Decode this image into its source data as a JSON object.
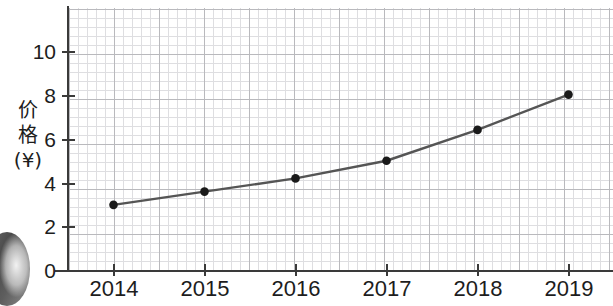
{
  "chart_data": {
    "type": "line",
    "title": "",
    "subtitle": "",
    "xlabel": "",
    "ylabel": "价格(¥)",
    "ylabel_lines": [
      "价",
      "格",
      "(¥)"
    ],
    "categories": [
      "2014",
      "2015",
      "2016",
      "2017",
      "2018",
      "2019"
    ],
    "x": [
      2014,
      2015,
      2016,
      2017,
      2018,
      2019
    ],
    "values": [
      3.0,
      3.6,
      4.2,
      5.0,
      6.4,
      8.0
    ],
    "series": [
      {
        "name": "价格(¥)",
        "values": [
          3.0,
          3.6,
          4.2,
          5.0,
          6.4,
          8.0
        ]
      }
    ],
    "xlim": [
      2013.6,
      2019.4
    ],
    "ylim": [
      0,
      11.6
    ],
    "yticks": [
      0,
      2,
      4,
      6,
      8,
      10
    ],
    "ytick_labels": [
      "0",
      "2",
      "4",
      "6",
      "8",
      "10"
    ],
    "xticks": [
      2014,
      2015,
      2016,
      2017,
      2018,
      2019
    ],
    "xtick_labels": [
      "2014",
      "2015",
      "2016",
      "2017",
      "2018",
      "2019"
    ],
    "grid": true,
    "grid_minor": true,
    "legend": false,
    "legend_position": "none",
    "marker": "circle",
    "line_color": "#555555",
    "marker_color": "#1a1a1a",
    "axis_color": "#3a3a3a",
    "grid_major_color": "#b9b9bd",
    "grid_minor_color": "#dedee1"
  },
  "axes": {
    "y_tick_labels": [
      "10",
      "8",
      "6",
      "4",
      "2",
      "0"
    ],
    "x_tick_labels": [
      "2014",
      "2015",
      "2016",
      "2017",
      "2018",
      "2019"
    ]
  },
  "artifact": {
    "name": "scan-shadow"
  }
}
